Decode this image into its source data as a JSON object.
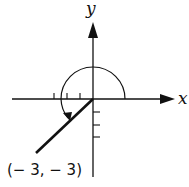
{
  "diagram": {
    "x_axis_label": "x",
    "y_axis_label": "y",
    "point_label": "(− 3,  − 3)",
    "point": {
      "x": -3,
      "y": -3
    },
    "angle_arc": "counterclockwise arc from positive x-axis to terminal side (225°)",
    "tick_marks": {
      "negative_x": 3,
      "negative_y": 3
    },
    "colors": {
      "stroke": "#111111",
      "background": "#ffffff"
    }
  }
}
